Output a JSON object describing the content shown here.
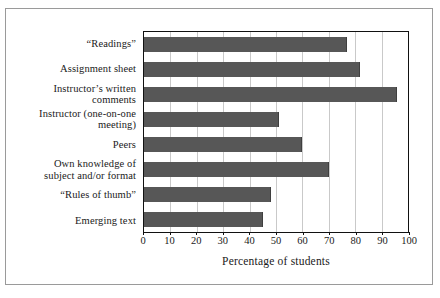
{
  "chart_data": {
    "type": "bar",
    "orientation": "horizontal",
    "title": "",
    "xlabel": "Percentage of students",
    "ylabel": "",
    "xlim": [
      0,
      100
    ],
    "xticks": [
      0,
      10,
      20,
      30,
      40,
      50,
      60,
      70,
      80,
      90,
      100
    ],
    "xtick_labels": [
      "0",
      "10",
      "20",
      "30",
      "40",
      "50",
      "60",
      "70",
      "80",
      "90",
      "100"
    ],
    "grid": "vertical",
    "legend": "none",
    "bar_color": "#575757",
    "gridline_color": "#c9c9c9",
    "frame_color": "#111111",
    "categories": [
      "“Readings”",
      "Assignment sheet",
      "Instructor’s written\ncomments",
      "Instructor (one-on-one\nmeeting)",
      "Peers",
      "Own knowledge of\nsubject and/or format",
      "“Rules of thumb”",
      "Emerging text"
    ],
    "values": [
      77,
      82,
      96,
      51,
      60,
      70,
      48,
      45
    ]
  }
}
